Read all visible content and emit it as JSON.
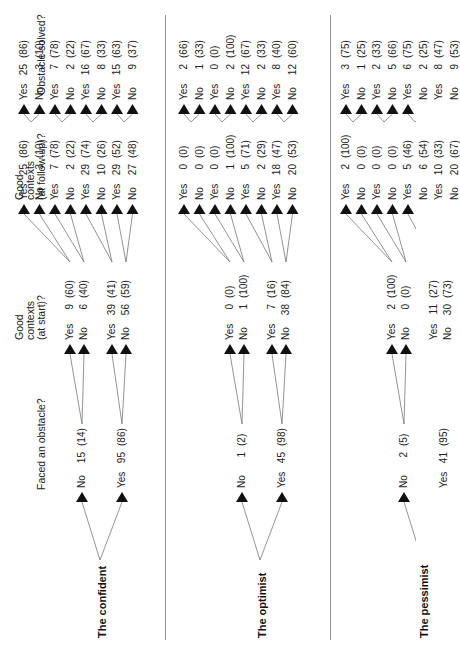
{
  "headers": {
    "faced": "Faced an obstacle?",
    "start": [
      "Good",
      "contexts",
      "(at start)?"
    ],
    "followup": [
      "Good",
      "contexts",
      "(at follow-up)?"
    ],
    "solved": "Obstacle solved?"
  },
  "groups": [
    {
      "name": "The confident",
      "faced": [
        {
          "label": "No",
          "n": "15",
          "pct": "(14)"
        },
        {
          "label": "Yes",
          "n": "95",
          "pct": "(86)"
        }
      ],
      "start": [
        {
          "label": "Yes",
          "n": "9",
          "pct": "(60)"
        },
        {
          "label": "No",
          "n": "6",
          "pct": "(40)"
        },
        {
          "label": "Yes",
          "n": "39",
          "pct": "(41)"
        },
        {
          "label": "No",
          "n": "56",
          "pct": "(59)"
        }
      ],
      "followup": [
        {
          "label": "Yes",
          "n": "25",
          "pct": "(86)"
        },
        {
          "label": "No",
          "n": "3",
          "pct": "(10)"
        },
        {
          "label": "Yes",
          "n": "7",
          "pct": "(78)"
        },
        {
          "label": "No",
          "n": "2",
          "pct": "(22)"
        },
        {
          "label": "Yes",
          "n": "29",
          "pct": "(74)"
        },
        {
          "label": "No",
          "n": "10",
          "pct": "(26)"
        },
        {
          "label": "Yes",
          "n": "29",
          "pct": "(52)"
        },
        {
          "label": "No",
          "n": "27",
          "pct": "(48)"
        }
      ],
      "solved": [
        {
          "label": "Yes",
          "n": "25",
          "pct": "(86)"
        },
        {
          "label": "No",
          "n": "3",
          "pct": "(10)"
        },
        {
          "label": "Yes",
          "n": "7",
          "pct": "(78)"
        },
        {
          "label": "No",
          "n": "2",
          "pct": "(22)"
        },
        {
          "label": "Yes",
          "n": "16",
          "pct": "(67)"
        },
        {
          "label": "No",
          "n": "8",
          "pct": "(33)"
        },
        {
          "label": "Yes",
          "n": "15",
          "pct": "(63)"
        },
        {
          "label": "No",
          "n": "9",
          "pct": "(37)"
        }
      ]
    },
    {
      "name": "The optimist",
      "faced": [
        {
          "label": "No",
          "n": "1",
          "pct": "(2)"
        },
        {
          "label": "Yes",
          "n": "45",
          "pct": "(98)"
        }
      ],
      "start": [
        {
          "label": "Yes",
          "n": "0",
          "pct": "(0)"
        },
        {
          "label": "No",
          "n": "1",
          "pct": "(100)"
        },
        {
          "label": "Yes",
          "n": "7",
          "pct": "(16)"
        },
        {
          "label": "No",
          "n": "38",
          "pct": "(84)"
        }
      ],
      "followup": [
        {
          "label": "Yes",
          "n": "0",
          "pct": "(0)"
        },
        {
          "label": "No",
          "n": "0",
          "pct": "(0)"
        },
        {
          "label": "Yes",
          "n": "0",
          "pct": "(0)"
        },
        {
          "label": "No",
          "n": "1",
          "pct": "(100)"
        },
        {
          "label": "Yes",
          "n": "5",
          "pct": "(71)"
        },
        {
          "label": "No",
          "n": "2",
          "pct": "(29)"
        },
        {
          "label": "Yes",
          "n": "18",
          "pct": "(47)"
        },
        {
          "label": "No",
          "n": "20",
          "pct": "(53)"
        }
      ],
      "solved": [
        {
          "label": "Yes",
          "n": "2",
          "pct": "(66)"
        },
        {
          "label": "No",
          "n": "1",
          "pct": "(33)"
        },
        {
          "label": "Yes",
          "n": "0",
          "pct": "(0)"
        },
        {
          "label": "No",
          "n": "2",
          "pct": "(100)"
        },
        {
          "label": "Yes",
          "n": "12",
          "pct": "(67)"
        },
        {
          "label": "No",
          "n": "2",
          "pct": "(33)"
        },
        {
          "label": "Yes",
          "n": "8",
          "pct": "(40)"
        },
        {
          "label": "No",
          "n": "12",
          "pct": "(60)"
        }
      ]
    },
    {
      "name": "The pessimist",
      "faced": [
        {
          "label": "No",
          "n": "2",
          "pct": "(5)"
        },
        {
          "label": "Yes",
          "n": "41",
          "pct": "(95)"
        }
      ],
      "start": [
        {
          "label": "Yes",
          "n": "2",
          "pct": "(100)"
        },
        {
          "label": "No",
          "n": "0",
          "pct": "(0)"
        },
        {
          "label": "Yes",
          "n": "11",
          "pct": "(27)"
        },
        {
          "label": "No",
          "n": "30",
          "pct": "(73)"
        }
      ],
      "followup": [
        {
          "label": "Yes",
          "n": "2",
          "pct": "(100)"
        },
        {
          "label": "No",
          "n": "0",
          "pct": "(0)"
        },
        {
          "label": "Yes",
          "n": "0",
          "pct": "(0)"
        },
        {
          "label": "No",
          "n": "0",
          "pct": "(0)"
        },
        {
          "label": "Yes",
          "n": "5",
          "pct": "(46)"
        },
        {
          "label": "No",
          "n": "6",
          "pct": "(54)"
        },
        {
          "label": "Yes",
          "n": "10",
          "pct": "(33)"
        },
        {
          "label": "No",
          "n": "20",
          "pct": "(67)"
        }
      ],
      "solved": [
        {
          "label": "Yes",
          "n": "3",
          "pct": "(75)"
        },
        {
          "label": "No",
          "n": "1",
          "pct": "(25)"
        },
        {
          "label": "Yes",
          "n": "2",
          "pct": "(33)"
        },
        {
          "label": "No",
          "n": "5",
          "pct": "(66)"
        },
        {
          "label": "Yes",
          "n": "6",
          "pct": "(75)"
        },
        {
          "label": "No",
          "n": "2",
          "pct": "(25)"
        },
        {
          "label": "Yes",
          "n": "8",
          "pct": "(47)"
        },
        {
          "label": "No",
          "n": "9",
          "pct": "(53)"
        }
      ]
    }
  ]
}
